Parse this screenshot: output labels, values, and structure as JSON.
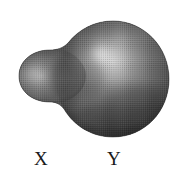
{
  "figure": {
    "type": "shaded-grayscale-illustration",
    "background_color": "#ffffff",
    "canvas": {
      "width": 189,
      "height": 180
    },
    "texture": "halftone dot screen",
    "labels": [
      {
        "id": "x",
        "text": "X",
        "refers_to": "small left lobe",
        "position": {
          "x": 34,
          "y": 149
        },
        "color": "#1a1a1a",
        "font_size_px": 19
      },
      {
        "id": "y",
        "text": "Y",
        "refers_to": "large right lobe",
        "position": {
          "x": 107,
          "y": 149
        },
        "color": "#1a1a1a",
        "font_size_px": 19
      }
    ],
    "lobes": [
      {
        "id": "small-lobe",
        "label": "X",
        "center": {
          "x": 52,
          "y": 76
        },
        "radius_x": 34,
        "radius_y": 27,
        "highlight": {
          "x": 33,
          "y": 73,
          "radius": 13
        },
        "fill_light": "#8d8d8d",
        "fill_mid": "#5a5a5a",
        "fill_dark": "#343434"
      },
      {
        "id": "large-lobe",
        "label": "Y",
        "center": {
          "x": 113,
          "y": 79
        },
        "radius_x": 56,
        "radius_y": 58,
        "highlight": {
          "x": 102,
          "y": 55,
          "radius": 30
        },
        "fill_light": "#a2a2a2",
        "fill_mid": "#5e5e5e",
        "fill_dark": "#2f2f2f"
      }
    ],
    "neck": {
      "description": "concave junction blending the two lobes",
      "top_y": 52,
      "bottom_y": 104,
      "x": 76
    },
    "palette": {
      "background": "#ffffff",
      "highlight": "#c9c9c9",
      "midtone": "#5e5e5e",
      "shadow": "#2b2b2b",
      "label_ink": "#1a1a1a"
    }
  }
}
